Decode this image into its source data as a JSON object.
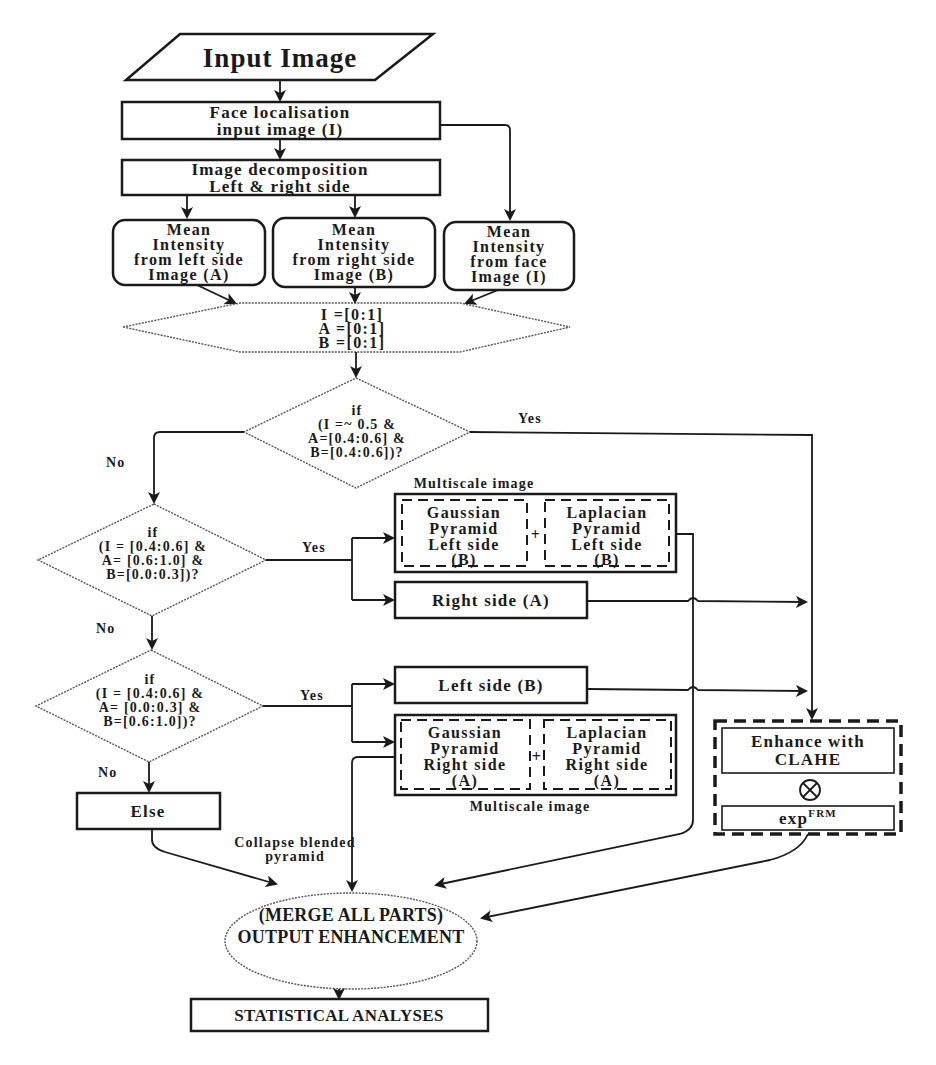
{
  "diagram": {
    "title_node": {
      "label": "Input Image"
    },
    "face_localisation": {
      "lines": [
        "Face localisation",
        "input image (I)"
      ]
    },
    "decomposition": {
      "lines": [
        "Image decomposition",
        "Left & right side"
      ]
    },
    "mean_left": {
      "lines": [
        "Mean",
        "Intensity",
        "from left side",
        "Image (A)"
      ]
    },
    "mean_right": {
      "lines": [
        "Mean",
        "Intensity",
        "from right side",
        "Image (B)"
      ]
    },
    "mean_face": {
      "lines": [
        "Mean",
        "Intensity",
        "from face",
        "Image (I)"
      ]
    },
    "ranges": {
      "lines": [
        "I =[0:1]",
        "A =[0:1]",
        "B =[0:1]"
      ]
    },
    "decision1": {
      "lines": [
        "if",
        "(I =~ 0.5 &",
        "A=[0.4:0.6] &",
        "B=[0.4:0.6])?"
      ],
      "yes": "Yes",
      "no": "No"
    },
    "decision2": {
      "lines": [
        "if",
        "(I = [0.4:0.6] &",
        "A= [0.6:1.0] &",
        "B=[0.0:0.3])?"
      ],
      "yes": "Yes",
      "no": "No"
    },
    "decision3": {
      "lines": [
        "if",
        "(I = [0.4:0.6] &",
        "A= [0.0:0.3] &",
        "B=[0.6:1.0])?"
      ],
      "yes": "Yes",
      "no": "No"
    },
    "multiscale_top": {
      "caption": "Multiscale image",
      "gaussian": [
        "Gaussian",
        "Pyramid",
        "Left side",
        "(B)"
      ],
      "plus": "+",
      "laplacian": [
        "Laplacian",
        "Pyramid",
        "Left side",
        "(B)"
      ]
    },
    "right_side_box": {
      "label": "Right side (A)"
    },
    "left_side_box": {
      "label": "Left side  (B)"
    },
    "multiscale_bottom": {
      "caption": "Multiscale image",
      "gaussian": [
        "Gaussian",
        "Pyramid",
        "Right side",
        "(A)"
      ],
      "plus": "+",
      "laplacian": [
        "Laplacian",
        "Pyramid",
        "Right side",
        "(A)"
      ]
    },
    "else_box": {
      "label": "Else"
    },
    "clahe": {
      "enhance_lines": [
        "Enhance with",
        "CLAHE"
      ],
      "operator": "⊗",
      "exp_base": "exp",
      "exp_sup": "FRM"
    },
    "collapse_label": {
      "lines": [
        "Collapse blended",
        "pyramid"
      ]
    },
    "merge": {
      "lines": [
        "(MERGE ALL PARTS)",
        "OUTPUT ENHANCEMENT"
      ]
    },
    "statistical": {
      "label": "STATISTICAL ANALYSES"
    }
  }
}
